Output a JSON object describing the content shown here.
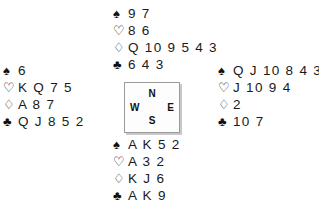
{
  "diagram": {
    "type": "bridge-deal",
    "suit_symbols": {
      "spade": "♠",
      "heart": "♡",
      "diamond": "♢",
      "club": "♣"
    },
    "compass": {
      "north": "N",
      "west": "W",
      "east": "E",
      "south": "S"
    },
    "hands": {
      "north": {
        "label": "North",
        "spades": "9 7",
        "hearts": "8 6",
        "diamonds": "Q 10 9 5 4 3",
        "clubs": "6 4 3"
      },
      "west": {
        "label": "West",
        "spades": "6",
        "hearts": "K Q 7 5",
        "diamonds": "A 8 7",
        "clubs": "Q J 8 5 2"
      },
      "east": {
        "label": "East",
        "spades": "Q J 10 8 4 3",
        "hearts": "J 10 9 4",
        "diamonds": "2",
        "clubs": "10 7"
      },
      "south": {
        "label": "South",
        "spades": "A K 5 2",
        "hearts": "A 3 2",
        "diamonds": "K J 6",
        "clubs": "A K 9"
      }
    },
    "colors": {
      "ink": "#1a1a1a",
      "box_border": "#9a9a9a",
      "box_shadow": "#c9c9c9",
      "background": "#ffffff"
    }
  }
}
